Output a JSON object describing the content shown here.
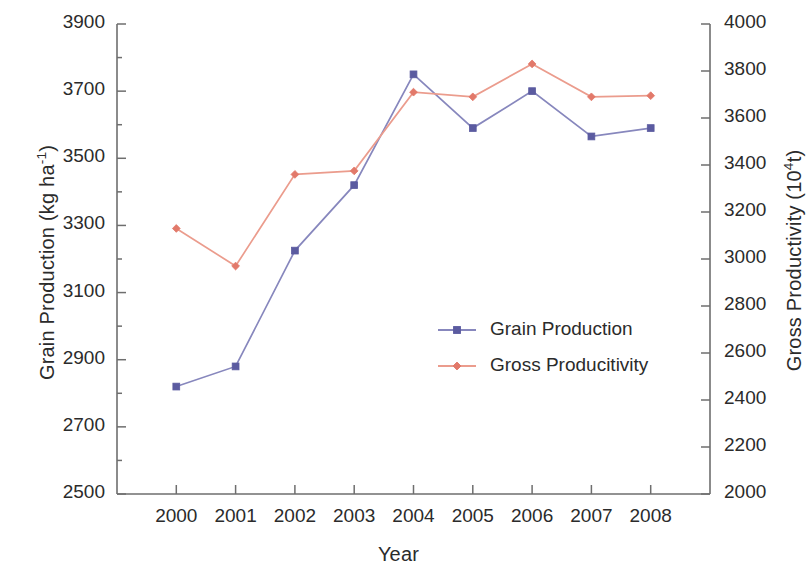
{
  "chart_data": {
    "type": "line",
    "title": "",
    "xlabel": "Year",
    "ylabel": "Grain Production (kg ha-1)",
    "y2label": "Gross Productivity (104t)",
    "categories": [
      "2000",
      "2001",
      "2002",
      "2003",
      "2004",
      "2005",
      "2006",
      "2007",
      "2008"
    ],
    "x": [
      2000,
      2001,
      2002,
      2003,
      2004,
      2005,
      2006,
      2007,
      2008
    ],
    "ylim": [
      2500,
      3900
    ],
    "y2lim": [
      2000,
      4000
    ],
    "yticks": [
      3900,
      3700,
      3500,
      3300,
      3100,
      2900,
      2700,
      2500
    ],
    "y2ticks": [
      4000,
      3800,
      3600,
      3400,
      3200,
      3000,
      2800,
      2600,
      2400,
      2200,
      2000
    ],
    "grid": false,
    "legend_position": "center",
    "series": [
      {
        "name": "Grain Production",
        "axis": "left",
        "color": "#5b5ba0",
        "marker": "square",
        "values": [
          2820,
          2880,
          3225,
          3420,
          3750,
          3590,
          3700,
          3565,
          3590
        ]
      },
      {
        "name": "Gross Producitivity",
        "axis": "right",
        "color": "#e2796a",
        "marker": "diamond",
        "values": [
          3130,
          2970,
          3360,
          3375,
          3710,
          3690,
          3830,
          3690,
          3695
        ]
      }
    ]
  },
  "axes": {
    "y_left": {
      "label_main": "Grain Production (kg ha",
      "label_sup": "-1",
      "label_tail": ")",
      "ticks": [
        "3900",
        "3700",
        "3500",
        "3300",
        "3100",
        "2900",
        "2700",
        "2500"
      ]
    },
    "y_right": {
      "label_main": "Gross Productivity (10",
      "label_sup": "4",
      "label_tail": "t)",
      "ticks": [
        "4000",
        "3800",
        "3600",
        "3400",
        "3200",
        "3000",
        "2800",
        "2600",
        "2400",
        "2200",
        "2000"
      ]
    },
    "x": {
      "label": "Year",
      "ticks": [
        "2000",
        "2001",
        "2002",
        "2003",
        "2004",
        "2005",
        "2006",
        "2007",
        "2008"
      ]
    }
  },
  "legend": {
    "entries": [
      {
        "label": "Grain Production",
        "color": "#5b5ba0"
      },
      {
        "label": "Gross Producitivity",
        "color": "#e2796a"
      }
    ]
  },
  "colors": {
    "grain": "#5b5ba0",
    "grain_line": "#8787bd",
    "gross": "#e2796a",
    "gross_line": "#eb9c8d",
    "axis": "#6e6e6e",
    "text": "#2b2b2b",
    "background": "#ffffff"
  }
}
